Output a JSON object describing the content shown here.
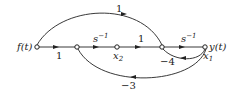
{
  "diagram": {
    "type": "signal-flow-graph",
    "nodes": {
      "input": "f(t)",
      "x2": "x",
      "x2_sub": "2",
      "x1": "x",
      "x1_sub": "1",
      "output": "y(t)"
    },
    "branches": {
      "f_to_n2": "1",
      "n2_to_x2": "s",
      "n2_to_x2_sup": "−1",
      "x2_to_n4": "1",
      "n4_to_x1": "s",
      "n4_to_x1_sup": "−1",
      "feedforward_f_to_n4": "1",
      "feedback_x1_to_n4": "−4",
      "feedback_x1_to_n2": "−3"
    },
    "color": "#222222"
  }
}
